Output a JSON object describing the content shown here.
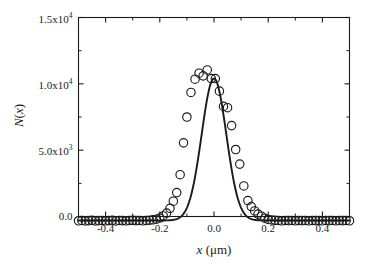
{
  "figure": {
    "background_color": "#ffffff",
    "foreground_color": "#1a1a1a"
  },
  "axes": {
    "y_title_main": "N",
    "y_title_paren_open": "(",
    "y_title_var": "x",
    "y_title_paren_close": ")",
    "x_title_var": "x",
    "x_title_unit": " (μm)",
    "y_ticks": [
      {
        "value": 0,
        "mantissa": "0.0",
        "exponent": ""
      },
      {
        "value": 5000,
        "mantissa": "5.0x10",
        "exponent": "3"
      },
      {
        "value": 10000,
        "mantissa": "1.0x10",
        "exponent": "4"
      },
      {
        "value": 15000,
        "mantissa": "1.5x10",
        "exponent": "4"
      }
    ],
    "x_ticks": [
      {
        "value": -0.4,
        "label": "-0.4"
      },
      {
        "value": -0.2,
        "label": "-0.2"
      },
      {
        "value": 0.0,
        "label": "0.0"
      },
      {
        "value": 0.2,
        "label": "0.2"
      },
      {
        "value": 0.4,
        "label": "0.4"
      }
    ]
  },
  "chart_data": {
    "type": "scatter",
    "title": "",
    "subtitle": "",
    "xlabel": "x (μm)",
    "ylabel": "N(x)",
    "xlim": [
      -0.5,
      0.5
    ],
    "ylim": [
      0,
      15000
    ],
    "xticks": [
      -0.4,
      -0.2,
      0.0,
      0.2,
      0.4
    ],
    "yticks": [
      0,
      5000,
      10000,
      15000
    ],
    "grid": false,
    "legend": "none",
    "frame": "box",
    "tick_direction": "in",
    "series": [
      {
        "name": "measured counts",
        "style": "open-circle-markers",
        "marker": "circle",
        "marker_filled": false,
        "marker_radius_px": 4.2,
        "x": [
          -0.5,
          -0.4875,
          -0.475,
          -0.4625,
          -0.45,
          -0.4375,
          -0.425,
          -0.4125,
          -0.4,
          -0.3875,
          -0.375,
          -0.3625,
          -0.35,
          -0.3375,
          -0.325,
          -0.3125,
          -0.3,
          -0.2875,
          -0.275,
          -0.2625,
          -0.25,
          -0.2375,
          -0.225,
          -0.2125,
          -0.2,
          -0.1875,
          -0.175,
          -0.1625,
          -0.15,
          -0.1375,
          -0.125,
          -0.1125,
          -0.1,
          -0.085,
          -0.07,
          -0.055,
          -0.04,
          -0.025,
          -0.01,
          0.005,
          0.02,
          0.035,
          0.05,
          0.065,
          0.08,
          0.095,
          0.11,
          0.125,
          0.1375,
          0.15,
          0.1625,
          0.175,
          0.1875,
          0.2,
          0.2125,
          0.225,
          0.2375,
          0.25,
          0.2625,
          0.275,
          0.2875,
          0.3,
          0.3125,
          0.325,
          0.3375,
          0.35,
          0.3625,
          0.375,
          0.3875,
          0.4,
          0.4125,
          0.425,
          0.4375,
          0.45,
          0.4625,
          0.475,
          0.4875,
          0.5
        ],
        "y": [
          -320,
          -300,
          -330,
          -310,
          -290,
          -330,
          -310,
          -300,
          -320,
          -310,
          -290,
          -330,
          -300,
          -310,
          -320,
          -300,
          -290,
          -310,
          -300,
          -320,
          -300,
          -280,
          -250,
          -200,
          -120,
          40,
          260,
          620,
          1150,
          1800,
          3150,
          5550,
          7500,
          9350,
          10350,
          10800,
          10600,
          11050,
          10400,
          10400,
          9450,
          8300,
          8200,
          6850,
          5050,
          3950,
          2300,
          1200,
          750,
          420,
          180,
          20,
          -130,
          -220,
          -260,
          -290,
          -300,
          -320,
          -300,
          -310,
          -300,
          -320,
          -300,
          -310,
          -300,
          -320,
          -300,
          -310,
          -300,
          -320,
          -300,
          -310,
          -300,
          -320,
          -300,
          -310,
          -300,
          -320
        ]
      },
      {
        "name": "gaussian fit",
        "style": "solid-line",
        "line_width_px": 1.9,
        "fit": {
          "function": "gaussian",
          "amplitude": 10700,
          "center": 0.0,
          "sigma": 0.0455,
          "baseline": -300
        }
      }
    ]
  }
}
